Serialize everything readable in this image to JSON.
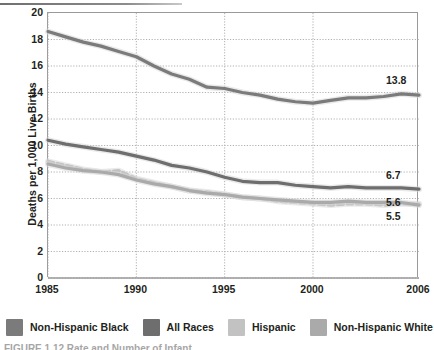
{
  "figure": {
    "caption": "FIGURE 1.12  Rate and Number of Infant",
    "ylabel": "Deaths per 1,000 Live Births"
  },
  "legend": {
    "items": [
      {
        "label": "Non-Hispanic Black",
        "color": "#7b7b7b",
        "swatch_name": "legend-swatch-non-hispanic-black"
      },
      {
        "label": "All Races",
        "color": "#6e6e6e",
        "swatch_name": "legend-swatch-all-races"
      },
      {
        "label": "Hispanic",
        "color": "#c2c2c2",
        "swatch_name": "legend-swatch-hispanic"
      },
      {
        "label": "Non-Hispanic White",
        "color": "#aaaaaa",
        "swatch_name": "legend-swatch-non-hispanic-white"
      }
    ]
  },
  "chart_data": {
    "type": "line",
    "title": "",
    "xlabel": "",
    "ylabel": "Deaths per 1,000 Live Births",
    "xlim": [
      1985,
      2006
    ],
    "ylim": [
      0,
      20
    ],
    "ytick_labels": [
      "0",
      "2",
      "4",
      "6",
      "8",
      "10",
      "12",
      "14",
      "16",
      "18",
      "20"
    ],
    "yticks": [
      0,
      2,
      4,
      6,
      8,
      10,
      12,
      14,
      16,
      18,
      20
    ],
    "xtick_labels": [
      "1985",
      "1990",
      "1995",
      "2000",
      "2006"
    ],
    "xticks": [
      1985,
      1990,
      1995,
      2000,
      2006
    ],
    "grid": true,
    "legend_position": "bottom",
    "x": [
      1985,
      1986,
      1987,
      1988,
      1989,
      1990,
      1991,
      1992,
      1993,
      1994,
      1995,
      1996,
      1997,
      1998,
      1999,
      2000,
      2001,
      2002,
      2003,
      2004,
      2005,
      2006
    ],
    "series": [
      {
        "name": "Non-Hispanic Black",
        "color": "#7b7b7b",
        "style": "solid",
        "end_label": "13.8",
        "values": [
          18.6,
          18.2,
          17.8,
          17.5,
          17.1,
          16.7,
          16.0,
          15.4,
          15.0,
          14.4,
          14.3,
          14.0,
          13.8,
          13.5,
          13.3,
          13.2,
          13.4,
          13.6,
          13.6,
          13.7,
          13.9,
          13.8
        ]
      },
      {
        "name": "All Races",
        "color": "#6e6e6e",
        "style": "solid",
        "end_label": "6.7",
        "values": [
          10.4,
          10.1,
          9.9,
          9.7,
          9.5,
          9.2,
          8.9,
          8.5,
          8.3,
          8.0,
          7.6,
          7.3,
          7.2,
          7.2,
          7.0,
          6.9,
          6.8,
          6.9,
          6.8,
          6.8,
          6.8,
          6.7
        ]
      },
      {
        "name": "Hispanic",
        "color": "#c2c2c2",
        "style": "dashed",
        "end_label": "5.6",
        "values": [
          8.8,
          8.5,
          8.2,
          8.0,
          8.1,
          7.5,
          7.2,
          6.9,
          6.6,
          6.5,
          6.3,
          6.1,
          6.0,
          5.8,
          5.7,
          5.6,
          5.5,
          5.6,
          5.6,
          5.5,
          5.6,
          5.6
        ]
      },
      {
        "name": "Non-Hispanic White",
        "color": "#aaaaaa",
        "style": "solid",
        "end_label": "5.5",
        "values": [
          8.6,
          8.3,
          8.1,
          8.0,
          7.8,
          7.4,
          7.1,
          6.9,
          6.6,
          6.4,
          6.3,
          6.1,
          6.0,
          5.9,
          5.8,
          5.7,
          5.7,
          5.8,
          5.7,
          5.7,
          5.7,
          5.5
        ]
      }
    ],
    "end_labels": [
      {
        "text": "13.8",
        "series": "Non-Hispanic Black",
        "value": 13.8
      },
      {
        "text": "6.7",
        "series": "All Races",
        "value": 6.7
      },
      {
        "text": "5.6",
        "series": "Hispanic",
        "value": 5.6
      },
      {
        "text": "5.5",
        "series": "Non-Hispanic White",
        "value": 5.5
      }
    ]
  }
}
